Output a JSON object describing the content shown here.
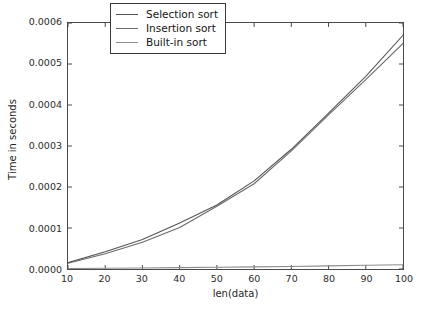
{
  "chart_data": {
    "type": "line",
    "title": "",
    "xlabel": "len(data)",
    "ylabel": "Time in seconds",
    "xlim": [
      10,
      100
    ],
    "ylim": [
      0.0,
      0.0006
    ],
    "xticks": [
      10,
      20,
      30,
      40,
      50,
      60,
      70,
      80,
      90,
      100
    ],
    "yticks": [
      0.0,
      0.0001,
      0.0002,
      0.0003,
      0.0004,
      0.0005,
      0.0006
    ],
    "xtick_labels": [
      "10",
      "20",
      "30",
      "40",
      "50",
      "60",
      "70",
      "80",
      "90",
      "100"
    ],
    "ytick_labels": [
      "0.0000",
      "0.0001",
      "0.0002",
      "0.0003",
      "0.0004",
      "0.0005",
      "0.0006"
    ],
    "grid": false,
    "legend_position": "upper center",
    "x": [
      10,
      20,
      30,
      40,
      50,
      60,
      70,
      80,
      90,
      100
    ],
    "series": [
      {
        "name": "Selection sort",
        "color": "#555555",
        "values": [
          1.55e-05,
          4.2e-05,
          7.2e-05,
          0.000112,
          0.000156,
          0.000215,
          0.000292,
          0.00038,
          0.00047,
          0.00057
        ]
      },
      {
        "name": "Insertion sort",
        "color": "#6a6a6a",
        "values": [
          1.4e-05,
          3.7e-05,
          6.5e-05,
          0.000101,
          0.000153,
          0.000208,
          0.000288,
          0.000376,
          0.000462,
          0.00055
        ]
      },
      {
        "name": "Built-in sort",
        "color": "#8c8c8c",
        "values": [
          1.2e-06,
          1.8e-06,
          2.5e-06,
          3.3e-06,
          4.2e-06,
          5.2e-06,
          6.3e-06,
          7.6e-06,
          9e-06,
          1.05e-05
        ]
      }
    ]
  },
  "legend": {
    "items": [
      {
        "label": "Selection sort"
      },
      {
        "label": "Insertion sort"
      },
      {
        "label": "Built-in sort"
      }
    ]
  },
  "axis": {
    "x_title": "len(data)",
    "y_title": "Time in seconds"
  },
  "colors": {
    "background": "#ffffff",
    "axis": "#4a4a4a",
    "text": "#1e1e1e"
  }
}
